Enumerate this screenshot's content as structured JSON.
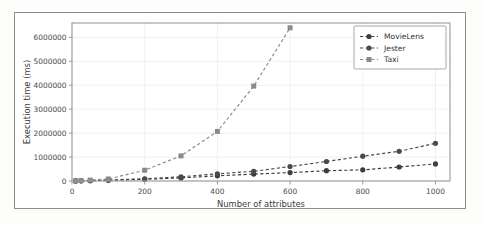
{
  "chart_data": {
    "type": "line",
    "title": "",
    "xlabel": "Number of attributes",
    "ylabel": "Execution time (ms)",
    "xlim": [
      0,
      1040
    ],
    "ylim": [
      0,
      6600000
    ],
    "xticks": [
      0,
      200,
      400,
      600,
      800,
      1000
    ],
    "xticklabels": [
      "0",
      "200",
      "400",
      "600",
      "800",
      "1000"
    ],
    "yticks": [
      0,
      1000000,
      2000000,
      3000000,
      4000000,
      5000000,
      6000000
    ],
    "yticklabels": [
      "0",
      "1000000",
      "2000000",
      "3000000",
      "4000000",
      "5000000",
      "6000000"
    ],
    "grid": true,
    "legend_position": "upper right",
    "series": [
      {
        "name": "MovieLens",
        "marker": "circle",
        "color": "#3d3d3d",
        "linestyle": "dashed",
        "x": [
          10,
          25,
          50,
          100,
          200,
          300,
          400,
          500,
          600,
          700,
          800,
          900,
          1000
        ],
        "y": [
          3000,
          6000,
          11000,
          30000,
          70000,
          130000,
          215000,
          290000,
          350000,
          430000,
          465000,
          585000,
          715000
        ]
      },
      {
        "name": "Jester",
        "marker": "circle",
        "color": "#4a4a4a",
        "linestyle": "dashed",
        "x": [
          10,
          25,
          50,
          100,
          200,
          300,
          400,
          500,
          600,
          700,
          800,
          900,
          1000
        ],
        "y": [
          4000,
          9000,
          16000,
          45000,
          95000,
          175000,
          300000,
          405000,
          605000,
          815000,
          1035000,
          1240000,
          1575000
        ]
      },
      {
        "name": "Taxi",
        "marker": "square",
        "color": "#8a8a8a",
        "linestyle": "dashed",
        "x": [
          10,
          25,
          50,
          100,
          200,
          300,
          400,
          500,
          600
        ],
        "y": [
          9000,
          20000,
          40000,
          85000,
          450000,
          1050000,
          2070000,
          3965000,
          6400000
        ]
      }
    ]
  }
}
